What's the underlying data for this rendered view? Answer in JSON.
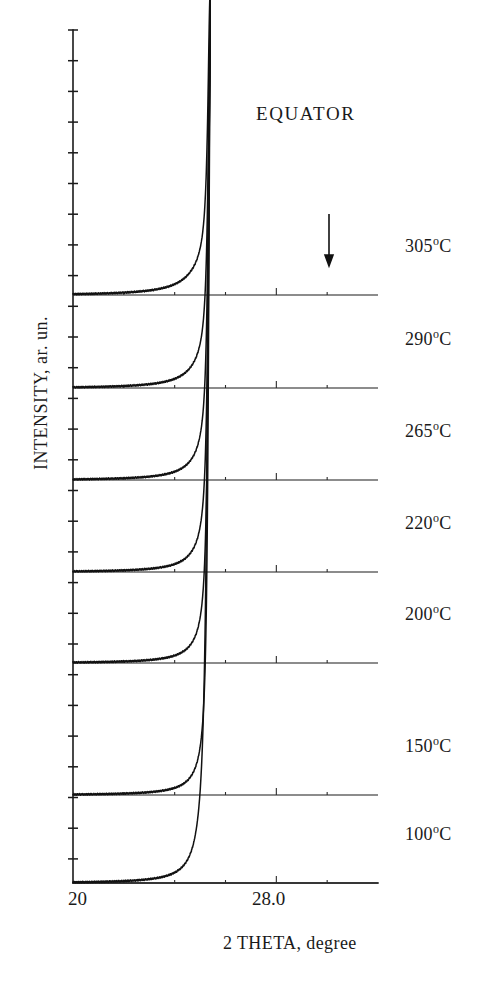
{
  "figure": {
    "annotation": "EQUATOR",
    "arrow": {
      "name": "down-arrow-annotation",
      "x": 329,
      "y_top": 214,
      "y_bottom": 266
    }
  },
  "axes": {
    "x": {
      "title": "2 THETA, degree",
      "tick_labels": [
        "20",
        "28.0"
      ],
      "tick_values": [
        20.0,
        28.0
      ],
      "range": [
        20.0,
        32.0
      ],
      "pixel_range": [
        73,
        378
      ]
    },
    "y": {
      "title": "INTENSITY, ar. un.",
      "ticks_visible": true
    }
  },
  "traces": [
    {
      "label": "305",
      "unit": "°C",
      "baseline_y": 295
    },
    {
      "label": "290",
      "unit": "°C",
      "baseline_y": 388
    },
    {
      "label": "265",
      "unit": "°C",
      "baseline_y": 480
    },
    {
      "label": "220",
      "unit": "°C",
      "baseline_y": 572
    },
    {
      "label": "200",
      "unit": "°C",
      "baseline_y": 663
    },
    {
      "label": "150",
      "unit": "°C",
      "baseline_y": 795
    },
    {
      "label": "100",
      "unit": "°C",
      "baseline_y": 883
    }
  ],
  "chart_data": {
    "type": "line",
    "title": "EQUATOR",
    "xlabel": "2 THETA, degree",
    "ylabel": "INTENSITY, ar. un.",
    "xlim": [
      20.0,
      32.0
    ],
    "xticks": [
      20.0,
      28.0
    ],
    "xtick_labels": [
      "20",
      "28.0"
    ],
    "grid": false,
    "legend": "right-side temperature labels",
    "main_peak_2theta": 25.4,
    "secondary_peak_2theta": 30.1,
    "arrow_marks_2theta": 30.1,
    "series": [
      {
        "name": "305°C",
        "temperature_c": 305,
        "baseline_y": 295,
        "main_peak_height": 268,
        "main_peak_width": 0.22,
        "broad_width": 1.55,
        "broad_height": 30,
        "secondary_peak_height": 2.5,
        "tail_height": 4.0
      },
      {
        "name": "290°C",
        "temperature_c": 290,
        "baseline_y": 388,
        "main_peak_height": 330,
        "main_peak_width": 0.2,
        "broad_width": 1.4,
        "broad_height": 28,
        "secondary_peak_height": 7.5,
        "tail_height": 3.6
      },
      {
        "name": "265°C",
        "temperature_c": 265,
        "baseline_y": 480,
        "main_peak_height": 420,
        "main_peak_width": 0.19,
        "broad_width": 1.3,
        "broad_height": 26,
        "secondary_peak_height": 6.5,
        "tail_height": 3.4
      },
      {
        "name": "220°C",
        "temperature_c": 220,
        "baseline_y": 572,
        "main_peak_height": 500,
        "main_peak_width": 0.18,
        "broad_width": 1.25,
        "broad_height": 25,
        "secondary_peak_height": 4.5,
        "tail_height": 3.2
      },
      {
        "name": "200°C",
        "temperature_c": 200,
        "baseline_y": 663,
        "main_peak_height": 590,
        "main_peak_width": 0.17,
        "broad_width": 1.2,
        "broad_height": 24,
        "secondary_peak_height": 1.6,
        "tail_height": 3.0
      },
      {
        "name": "150°C",
        "temperature_c": 150,
        "baseline_y": 795,
        "main_peak_height": 700,
        "main_peak_width": 0.17,
        "broad_width": 1.15,
        "broad_height": 22,
        "secondary_peak_height": 1.2,
        "tail_height": 2.6
      },
      {
        "name": "100°C",
        "temperature_c": 100,
        "baseline_y": 883,
        "main_peak_height": 800,
        "main_peak_width": 0.26,
        "broad_width": 1.05,
        "broad_height": 20,
        "secondary_peak_height": 0.8,
        "tail_height": 2.2
      }
    ]
  },
  "colors": {
    "ink": "#111111",
    "paper": "#ffffff"
  }
}
